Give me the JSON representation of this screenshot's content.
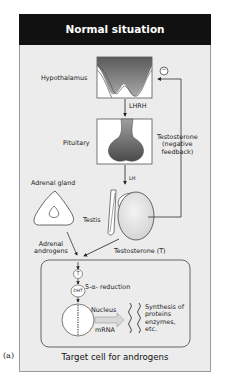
{
  "title": "Normal situation",
  "panel_label": "(a)",
  "footer": "Target cell for androgens",
  "labels": {
    "hypothalamus": "Hypothalamus",
    "lhrh": "LHRH",
    "pituitary": "Pituitary",
    "lh": "LH",
    "feedback_sign": "−",
    "testosterone_feedback_1": "Testosterone",
    "testosterone_feedback_2": "(negative",
    "testosterone_feedback_3": "feedback)",
    "adrenal_gland": "Adrenal gland",
    "testis": "Testis",
    "adrenal_androgens_1": "Adrenal",
    "adrenal_androgens_2": "androgens",
    "testosterone_t": "Testosterone (T)",
    "t_circle": "T",
    "reduction": "5-α- reduction",
    "dht": "DHT",
    "nucleus": "Nucleus",
    "mrna": "mRNA",
    "synthesis_1": "Synthesis of",
    "synthesis_2": "proteins",
    "synthesis_3": "enzymes,",
    "synthesis_4": "etc."
  }
}
